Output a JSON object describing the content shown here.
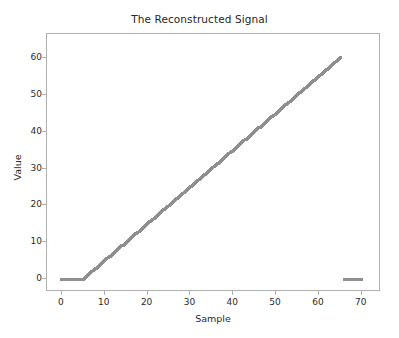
{
  "chart_data": {
    "type": "scatter",
    "title": "The Reconstructed Signal",
    "xlabel": "Sample",
    "ylabel": "Value",
    "xlim": [
      -3.5,
      74.5
    ],
    "ylim": [
      -3.5,
      66.5
    ],
    "xticks": [
      0,
      10,
      20,
      30,
      40,
      50,
      60,
      70
    ],
    "xtick_labels": [
      "0",
      "10",
      "20",
      "30",
      "40",
      "50",
      "60",
      "70"
    ],
    "yticks": [
      0,
      10,
      20,
      30,
      40,
      50,
      60
    ],
    "ytick_labels": [
      "0",
      "10",
      "20",
      "30",
      "40",
      "50",
      "60"
    ],
    "grid": false,
    "legend": false,
    "marker_color": "#8f8f8f",
    "marker_style": "x",
    "series": [
      {
        "name": "Reconstructed Signal",
        "x": [
          0,
          1,
          2,
          3,
          4,
          5,
          6,
          7,
          8,
          9,
          10,
          11,
          12,
          13,
          14,
          15,
          16,
          17,
          18,
          19,
          20,
          21,
          22,
          23,
          24,
          25,
          26,
          27,
          28,
          29,
          30,
          31,
          32,
          33,
          34,
          35,
          36,
          37,
          38,
          39,
          40,
          41,
          42,
          43,
          44,
          45,
          46,
          47,
          48,
          49,
          50,
          51,
          52,
          53,
          54,
          55,
          56,
          57,
          58,
          59,
          60,
          61,
          62,
          63,
          64,
          65,
          66,
          67,
          68,
          69,
          70
        ],
        "y": [
          0,
          0,
          0,
          0,
          0,
          0,
          1,
          2,
          3,
          4,
          5,
          6,
          7,
          8,
          9,
          10,
          11,
          12,
          13,
          14,
          15,
          16,
          17,
          18,
          19,
          20,
          21,
          22,
          23,
          24,
          25,
          26,
          27,
          28,
          29,
          30,
          31,
          32,
          33,
          34,
          35,
          36,
          37,
          38,
          39,
          40,
          41,
          42,
          43,
          44,
          45,
          46,
          47,
          48,
          49,
          50,
          51,
          52,
          53,
          54,
          55,
          56,
          57,
          58,
          59,
          60,
          0,
          0,
          0,
          0,
          0
        ]
      }
    ],
    "annotations": [
      "Flat zero segment for samples 0 to 5",
      "Linear ramp from sample 5 to sample 65 reaching about 63",
      "Isolated zero-valued cluster near samples 66 to 70"
    ]
  }
}
